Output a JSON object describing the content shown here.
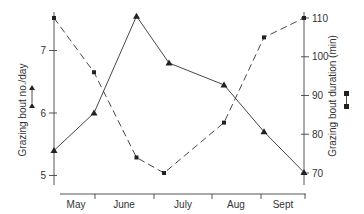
{
  "chart_data": {
    "type": "line",
    "title": "",
    "categories": [
      "May",
      "June",
      "July",
      "Aug",
      "Sept"
    ],
    "xlabel": "",
    "ylabel": "Grazing bout no./day",
    "ylabel_right": "Grazing bout duration (min)",
    "ylim": [
      4.9,
      7.6
    ],
    "ylim_right": [
      67,
      111
    ],
    "yticks": [
      5,
      6,
      7
    ],
    "yticks_right": [
      70,
      80,
      90,
      100,
      110
    ],
    "grid": false,
    "legend_position": "axis-labels",
    "series": [
      {
        "name": "Grazing bout no./day",
        "axis": "left",
        "marker": "triangle",
        "line": "solid",
        "x": [
          0.0,
          0.16,
          0.33,
          0.46,
          0.68,
          0.84,
          1.0
        ],
        "values": [
          5.4,
          6.0,
          7.55,
          6.8,
          6.45,
          5.7,
          5.05
        ]
      },
      {
        "name": "Grazing bout duration (min)",
        "axis": "right",
        "marker": "square",
        "line": "dashed",
        "x": [
          0.0,
          0.16,
          0.33,
          0.44,
          0.68,
          0.84,
          1.0
        ],
        "values": [
          110,
          96,
          74,
          70,
          83,
          105,
          110
        ]
      }
    ]
  },
  "labels": {
    "left_axis": "Grazing bout no./day",
    "right_axis": "Grazing bout duration (min)",
    "left_ticks": [
      "5",
      "6",
      "7"
    ],
    "right_ticks": [
      "70",
      "80",
      "90",
      "100",
      "110"
    ],
    "months": [
      "May",
      "June",
      "July",
      "Aug",
      "Sept"
    ]
  }
}
